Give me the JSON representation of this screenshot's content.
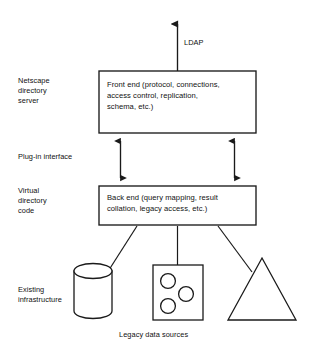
{
  "diagram": {
    "background_color": "#ffffff",
    "stroke_color": "#1a1a1a",
    "labels": {
      "ldap": "LDAP",
      "netscape_directory_server": "Netscape\ndirectory\nserver",
      "plugin_interface": "Plug-in interface",
      "virtual_directory_code": "Virtual\ndirectory\ncode",
      "existing_infrastructure": "Existing\ninfrastructure",
      "legacy_data_sources": "Legacy data sources"
    },
    "boxes": {
      "front_end": {
        "text": "Front end (protocol, connections,\naccess control, replication,\nschema, etc.)",
        "x": 99,
        "y": 71,
        "width": 157,
        "height": 62
      },
      "back_end": {
        "text": "Back end (query mapping, result\ncollation, legacy access, etc.)",
        "x": 99,
        "y": 186,
        "width": 157,
        "height": 39
      }
    },
    "connectors": {
      "ldap_arrow": "single-headed-up-arrow",
      "plugin_arrow_left": "double-headed-vertical-arrow",
      "plugin_arrow_right": "double-headed-vertical-arrow",
      "backend_to_cylinder": "plain-line",
      "backend_to_square": "plain-line",
      "backend_to_triangle": "plain-line"
    },
    "data_sources": [
      {
        "name": "database-cylinder",
        "shape": "cylinder"
      },
      {
        "name": "document-square",
        "shape": "square-with-three-circles",
        "circle_count": 3
      },
      {
        "name": "triangle-source",
        "shape": "triangle"
      }
    ]
  }
}
